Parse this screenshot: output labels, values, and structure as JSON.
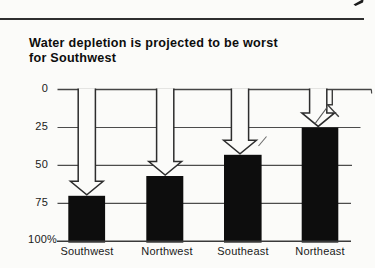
{
  "title": {
    "line1": "Water depletion is projected to be worst",
    "line2": "for Southwest"
  },
  "chart_data": {
    "type": "bar",
    "title": "Water depletion is projected to be worst for Southwest",
    "categories": [
      "Southwest",
      "Northwest",
      "Southeast",
      "Northeast"
    ],
    "values": [
      70,
      57,
      43,
      25
    ],
    "value_meaning": "percent of water depleted (0 at top, 100% at bottom)",
    "y_axis": {
      "ticks": [
        0,
        25,
        50,
        75,
        100
      ],
      "tick_labels": [
        "0",
        "25",
        "50",
        "75",
        "100%"
      ],
      "inverted": true,
      "range": [
        0,
        100
      ],
      "grid": true
    },
    "annotation": "white block arrows point down from the 0 line to the top of each black bar",
    "bar_color": "#0d0d0d",
    "line_color": "#454545",
    "background_color": "#fbfbf9"
  }
}
